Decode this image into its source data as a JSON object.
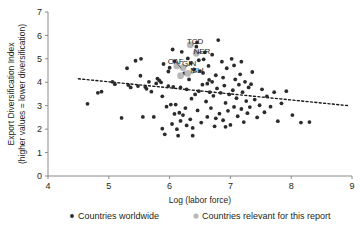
{
  "chart_data": {
    "type": "scatter",
    "title": "",
    "xlabel": "Log (labor force)",
    "ylabel": "Export Diversification Index",
    "ylabel_line2": "(higher values = lower diversification)",
    "xlim": [
      4,
      9
    ],
    "ylim": [
      0,
      7
    ],
    "xticks": [
      "4",
      "5",
      "6",
      "7",
      "8",
      "9"
    ],
    "yticks": [
      "0",
      "1",
      "2",
      "3",
      "4",
      "5",
      "6",
      "7"
    ],
    "grid": false,
    "legend_position": "bottom",
    "colors": {
      "worldwide": "#2b2b2b",
      "report": "#b9b9b9",
      "trendline": "#1a1a1a",
      "axis": "#8a8a8a"
    },
    "series": [
      {
        "name": "Countries worldwide",
        "marker": "dot-dark",
        "points": [
          [
            4.65,
            3.08
          ],
          [
            4.82,
            3.55
          ],
          [
            4.88,
            3.6
          ],
          [
            5.06,
            4.02
          ],
          [
            5.1,
            3.92
          ],
          [
            5.21,
            2.48
          ],
          [
            5.3,
            4.6
          ],
          [
            5.32,
            3.88
          ],
          [
            5.36,
            3.78
          ],
          [
            5.44,
            4.92
          ],
          [
            5.48,
            3.84
          ],
          [
            5.52,
            4.28
          ],
          [
            5.53,
            5.0
          ],
          [
            5.56,
            2.52
          ],
          [
            5.6,
            3.8
          ],
          [
            5.62,
            3.72
          ],
          [
            5.66,
            4.02
          ],
          [
            5.7,
            3.6
          ],
          [
            5.74,
            2.52
          ],
          [
            5.78,
            3.95
          ],
          [
            5.8,
            4.16
          ],
          [
            5.83,
            4.08
          ],
          [
            5.86,
            4.0
          ],
          [
            5.88,
            2.02
          ],
          [
            5.9,
            4.78
          ],
          [
            5.92,
            1.78
          ],
          [
            5.95,
            2.96
          ],
          [
            5.98,
            3.84
          ],
          [
            6.0,
            4.62
          ],
          [
            6.02,
            3.05
          ],
          [
            6.04,
            2.22
          ],
          [
            6.06,
            3.8
          ],
          [
            6.08,
            4.9
          ],
          [
            6.1,
            3.05
          ],
          [
            6.12,
            2.0
          ],
          [
            6.14,
            1.72
          ],
          [
            6.16,
            2.7
          ],
          [
            6.18,
            3.78
          ],
          [
            6.2,
            5.3
          ],
          [
            6.22,
            2.6
          ],
          [
            6.24,
            4.38
          ],
          [
            6.26,
            2.9
          ],
          [
            6.28,
            3.7
          ],
          [
            6.3,
            5.02
          ],
          [
            6.32,
            4.12
          ],
          [
            6.34,
            2.42
          ],
          [
            6.36,
            3.3
          ],
          [
            6.38,
            2.05
          ],
          [
            6.4,
            4.55
          ],
          [
            6.42,
            3.48
          ],
          [
            6.44,
            5.52
          ],
          [
            6.46,
            2.8
          ],
          [
            6.48,
            3.62
          ],
          [
            6.5,
            4.48
          ],
          [
            6.52,
            2.28
          ],
          [
            6.54,
            3.9
          ],
          [
            6.56,
            4.98
          ],
          [
            6.58,
            5.28
          ],
          [
            6.6,
            3.18
          ],
          [
            6.62,
            2.52
          ],
          [
            6.64,
            4.7
          ],
          [
            6.66,
            3.58
          ],
          [
            6.68,
            2.9
          ],
          [
            6.7,
            5.18
          ],
          [
            6.72,
            3.42
          ],
          [
            6.74,
            2.12
          ],
          [
            6.76,
            4.3
          ],
          [
            6.78,
            3.74
          ],
          [
            6.8,
            5.8
          ],
          [
            6.82,
            2.66
          ],
          [
            6.84,
            3.55
          ],
          [
            6.86,
            4.88
          ],
          [
            6.88,
            2.38
          ],
          [
            6.9,
            3.86
          ],
          [
            6.92,
            3.12
          ],
          [
            6.94,
            4.6
          ],
          [
            6.96,
            2.78
          ],
          [
            6.98,
            3.48
          ],
          [
            7.0,
            2.18
          ],
          [
            7.02,
            5.0
          ],
          [
            7.04,
            3.66
          ],
          [
            7.06,
            2.95
          ],
          [
            7.08,
            4.12
          ],
          [
            7.1,
            3.32
          ],
          [
            7.12,
            2.55
          ],
          [
            7.14,
            3.9
          ],
          [
            7.16,
            4.34
          ],
          [
            7.18,
            2.86
          ],
          [
            7.2,
            3.58
          ],
          [
            7.22,
            2.3
          ],
          [
            7.24,
            4.02
          ],
          [
            7.26,
            3.2
          ],
          [
            7.28,
            2.68
          ],
          [
            7.3,
            3.78
          ],
          [
            7.32,
            2.94
          ],
          [
            7.36,
            4.44
          ],
          [
            7.4,
            3.26
          ],
          [
            7.44,
            2.5
          ],
          [
            7.48,
            3.02
          ],
          [
            7.52,
            3.7
          ],
          [
            7.56,
            2.72
          ],
          [
            7.6,
            3.4
          ],
          [
            7.66,
            2.96
          ],
          [
            7.72,
            3.58
          ],
          [
            7.78,
            2.34
          ],
          [
            7.84,
            3.1
          ],
          [
            7.92,
            3.62
          ],
          [
            8.02,
            2.6
          ],
          [
            8.16,
            2.28
          ],
          [
            8.3,
            2.3
          ],
          [
            6.05,
            5.4
          ],
          [
            6.45,
            5.7
          ],
          [
            6.55,
            4.4
          ],
          [
            6.35,
            4.82
          ],
          [
            6.65,
            4.1
          ],
          [
            5.98,
            4.46
          ],
          [
            6.28,
            2.16
          ],
          [
            6.38,
            1.72
          ],
          [
            6.18,
            2.35
          ],
          [
            6.08,
            2.65
          ],
          [
            6.62,
            3.94
          ],
          [
            6.76,
            2.46
          ],
          [
            6.88,
            4.2
          ],
          [
            7.06,
            4.72
          ],
          [
            6.92,
            2.1
          ],
          [
            7.18,
            4.88
          ],
          [
            6.48,
            4.94
          ],
          [
            5.88,
            3.4
          ],
          [
            6.7,
            4.02
          ],
          [
            7.34,
            3.92
          ]
        ]
      },
      {
        "name": "Countries relevant for this report",
        "marker": "dot-light",
        "points": [
          [
            6.34,
            5.6
          ],
          [
            6.44,
            5.24
          ],
          [
            6.22,
            4.62
          ],
          [
            6.3,
            4.38
          ],
          [
            6.12,
            4.7
          ],
          [
            6.18,
            4.28
          ]
        ]
      }
    ],
    "country_labels": [
      {
        "code": "CAF",
        "x": 6.1,
        "y": 4.8,
        "anchor_x": 6.19,
        "anchor_y": 4.6
      },
      {
        "code": "TCD",
        "x": 6.42,
        "y": 5.62,
        "anchor_x": 6.37,
        "anchor_y": 5.58
      },
      {
        "code": "NER",
        "x": 6.53,
        "y": 5.22,
        "anchor_x": 6.46,
        "anchor_y": 5.26
      },
      {
        "code": "GIN",
        "x": 6.32,
        "y": 4.68,
        "anchor_x": 6.26,
        "anchor_y": 4.64
      },
      {
        "code": "MLI",
        "x": 6.45,
        "y": 4.4,
        "anchor_x": 6.36,
        "anchor_y": 4.38
      }
    ],
    "trendline": {
      "x_start": 4.5,
      "y_start": 4.15,
      "x_end": 8.95,
      "y_end": 3.0,
      "style": "dashed"
    },
    "annotations": []
  },
  "legend": {
    "items": [
      {
        "label": "Countries worldwide",
        "marker": "dot-dark"
      },
      {
        "label": "Countries relevant for this report",
        "marker": "dot-light"
      }
    ]
  }
}
